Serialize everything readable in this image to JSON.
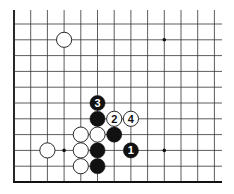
{
  "diagram": {
    "type": "go-board-corner",
    "board_corner": "bottom-left",
    "grid": {
      "columns_visible": 13,
      "rows_visible": 11,
      "origin_x": 14,
      "origin_y": 24,
      "spacing_x": 16.7,
      "spacing_y": 15.8,
      "right_x": 222,
      "bottom_y": 182
    },
    "star_points": [
      {
        "col": 9,
        "row": 1
      },
      {
        "col": 3,
        "row": 8
      },
      {
        "col": 9,
        "row": 8
      }
    ],
    "stones": [
      {
        "color": "white",
        "col": 3,
        "row": 1,
        "label": ""
      },
      {
        "color": "black",
        "col": 5,
        "row": 5,
        "label": "3"
      },
      {
        "color": "black",
        "col": 5,
        "row": 6,
        "label": ""
      },
      {
        "color": "white",
        "col": 6,
        "row": 6,
        "label": "2"
      },
      {
        "color": "white",
        "col": 7,
        "row": 6,
        "label": "4"
      },
      {
        "color": "white",
        "col": 4,
        "row": 7,
        "label": ""
      },
      {
        "color": "white",
        "col": 5,
        "row": 7,
        "label": ""
      },
      {
        "color": "black",
        "col": 6,
        "row": 7,
        "label": ""
      },
      {
        "color": "white",
        "col": 2,
        "row": 8,
        "label": ""
      },
      {
        "color": "white",
        "col": 4,
        "row": 8,
        "label": ""
      },
      {
        "color": "black",
        "col": 5,
        "row": 8,
        "label": ""
      },
      {
        "color": "black",
        "col": 7,
        "row": 8,
        "label": "1"
      },
      {
        "color": "white",
        "col": 4,
        "row": 9,
        "label": ""
      },
      {
        "color": "black",
        "col": 5,
        "row": 9,
        "label": ""
      }
    ],
    "colors": {
      "line": "#333333",
      "edge": "#111111",
      "black_stone": "#111111",
      "white_stone": "#ffffff",
      "background": "#ffffff"
    }
  }
}
